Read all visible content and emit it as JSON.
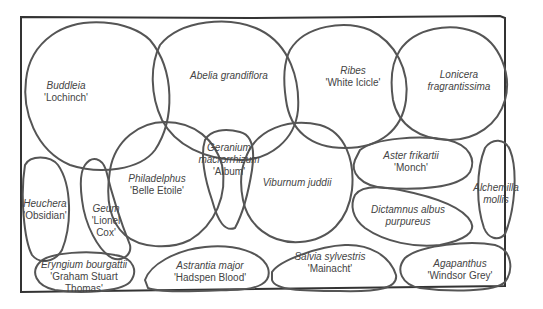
{
  "diagram": {
    "type": "planting-plan",
    "plants": [
      {
        "id": "buddleia",
        "name": "Buddleia",
        "cultivar": "'Lochinch'"
      },
      {
        "id": "abelia",
        "name": "Abelia grandiflora",
        "cultivar": ""
      },
      {
        "id": "ribes",
        "name": "Ribes",
        "cultivar": "'White Icicle'"
      },
      {
        "id": "lonicera",
        "name": "Lonicera fragrantissima",
        "name_line1": "Lonicera",
        "name_line2": "fragrantissima",
        "cultivar": ""
      },
      {
        "id": "heuchera",
        "name": "Heuchera",
        "cultivar": "'Obsidian'"
      },
      {
        "id": "geum",
        "name": "Geum",
        "cultivar_line1": "'Lionel",
        "cultivar_line2": "Cox'"
      },
      {
        "id": "philadelphus",
        "name": "Philadelphus",
        "cultivar": "'Belle Etoile'"
      },
      {
        "id": "geranium",
        "name_line1": "Geranium",
        "name_line2": "macrorrhizum",
        "cultivar": "'Album'"
      },
      {
        "id": "viburnum",
        "name": "Viburnum juddii",
        "cultivar": ""
      },
      {
        "id": "aster",
        "name": "Aster frikartii",
        "cultivar": "'Monch'"
      },
      {
        "id": "alchemilla",
        "name_line1": "Alchemilla",
        "name_line2": "mollis"
      },
      {
        "id": "dictamnus",
        "name_line1": "Dictamnus albus",
        "name_line2": "purpureus"
      },
      {
        "id": "eryngium",
        "name": "Eryngium bourgattii",
        "cultivar_line1": "'Graham Stuart",
        "cultivar_line2": "Thomas'"
      },
      {
        "id": "astrantia",
        "name": "Astrantia major",
        "cultivar": "'Hadspen Blood'"
      },
      {
        "id": "salvia",
        "name": "Salvia sylvestris",
        "cultivar": "'Mainacht'"
      },
      {
        "id": "agapanthus",
        "name": "Agapanthus",
        "cultivar": "'Windsor Grey'"
      }
    ]
  }
}
